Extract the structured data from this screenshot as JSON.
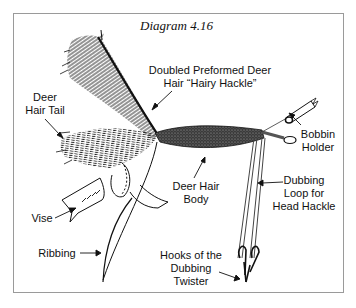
{
  "diagram": {
    "title": "Diagram 4.16",
    "labels": {
      "hairy_hackle": [
        "Doubled Preformed Deer",
        "Hair “Hairy Hackle”"
      ],
      "deer_hair_tail": [
        "Deer",
        "Hair Tail"
      ],
      "bobbin_holder": [
        "Bobbin",
        "Holder"
      ],
      "deer_hair_body": [
        "Deer Hair",
        "Body"
      ],
      "dubbing_loop": [
        "Dubbing",
        "Loop for",
        "Head Hackle"
      ],
      "vise": [
        "Vise"
      ],
      "ribbing": [
        "Ribbing"
      ],
      "hooks_twister": [
        "Hooks of the",
        "Dubbing",
        "Twister"
      ]
    },
    "colors": {
      "ink": "#111111",
      "frame": "#9a9a9a",
      "background": "#ffffff"
    }
  }
}
